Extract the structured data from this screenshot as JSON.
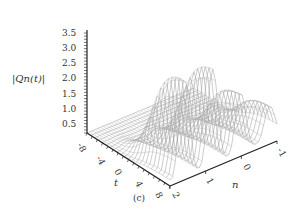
{
  "chart_data": {
    "type": "surface3d",
    "title": "",
    "caption": "(c)",
    "zlabel": "|Qn(t)|",
    "xlabel": "t",
    "ylabel": "n",
    "z_ticks": [
      "0.5",
      "1.0",
      "1.5",
      "2.0",
      "2.5",
      "3.0",
      "3.5"
    ],
    "t_ticks": [
      "-8",
      "-4",
      "0",
      "4",
      "8"
    ],
    "n_ticks": [
      "2",
      "1",
      "0",
      "-1"
    ],
    "zlim": [
      0.3,
      3.5
    ],
    "tlim": [
      -8,
      8
    ],
    "nlim": [
      -1,
      2
    ],
    "peaks_approx": [
      {
        "n": 2.0,
        "t": 8,
        "z": 3.45
      },
      {
        "n": 1.6,
        "t": 8,
        "z": 3.35
      },
      {
        "n": 1.2,
        "t": 8,
        "z": 3.25
      },
      {
        "n": 0.8,
        "t": 8,
        "z": 3.1
      },
      {
        "n": 0.4,
        "t": 8,
        "z": 2.95
      },
      {
        "n": 0.0,
        "t": 8,
        "z": 2.3
      },
      {
        "n": -0.5,
        "t": 8,
        "z": 1.4
      }
    ],
    "grid": false,
    "legend": null
  }
}
